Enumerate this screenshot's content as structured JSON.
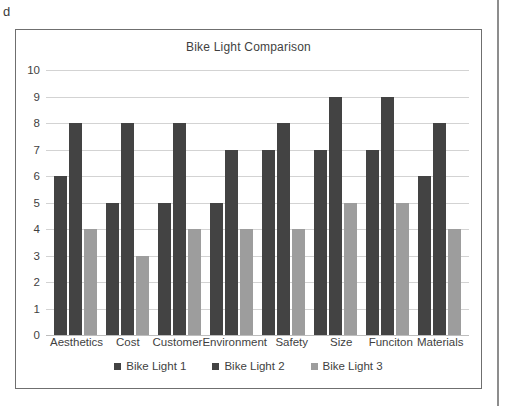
{
  "page": {
    "margin_letter": "d"
  },
  "chart_data": {
    "type": "bar",
    "title": "Bike Light Comparison",
    "xlabel": "",
    "ylabel": "",
    "ylim": [
      0,
      10
    ],
    "ytick_labels": [
      "10",
      "9",
      "8",
      "7",
      "6",
      "5",
      "4",
      "3",
      "2",
      "1",
      "0"
    ],
    "ytick_values": [
      10,
      9,
      8,
      7,
      6,
      5,
      4,
      3,
      2,
      1,
      0
    ],
    "grid": true,
    "legend_position": "bottom",
    "categories": [
      "Aesthetics",
      "Cost",
      "Customer",
      "Environment",
      "Safety",
      "Size",
      "Funciton",
      "Materials"
    ],
    "series": [
      {
        "name": "Bike Light 1",
        "color": "#434343",
        "values": [
          6,
          5,
          5,
          5,
          7,
          7,
          7,
          6
        ]
      },
      {
        "name": "Bike Light 2",
        "color": "#434343",
        "values": [
          8,
          8,
          8,
          7,
          8,
          9,
          9,
          8
        ]
      },
      {
        "name": "Bike Light 3",
        "color": "#9d9d9d",
        "values": [
          4,
          3,
          4,
          4,
          4,
          5,
          5,
          4
        ]
      }
    ]
  }
}
